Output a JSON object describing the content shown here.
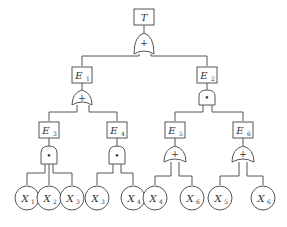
{
  "diagram": {
    "type": "fault-tree",
    "top": {
      "label": "T",
      "gate": "OR",
      "gate_symbol": "+"
    },
    "events": [
      {
        "id": "E1",
        "base": "E",
        "sub": "1",
        "gate": "OR",
        "gate_symbol": "+"
      },
      {
        "id": "E2",
        "base": "E",
        "sub": "2",
        "gate": "AND",
        "gate_symbol": "•"
      },
      {
        "id": "E3",
        "base": "E",
        "sub": "3",
        "gate": "AND",
        "gate_symbol": "•"
      },
      {
        "id": "E4",
        "base": "E",
        "sub": "4",
        "gate": "AND",
        "gate_symbol": "•"
      },
      {
        "id": "E5",
        "base": "E",
        "sub": "5",
        "gate": "OR",
        "gate_symbol": "+"
      },
      {
        "id": "E6",
        "base": "E",
        "sub": "6",
        "gate": "OR",
        "gate_symbol": "+"
      }
    ],
    "leaves": [
      {
        "base": "X",
        "sub": "1",
        "parent": "E3"
      },
      {
        "base": "X",
        "sub": "2",
        "parent": "E3"
      },
      {
        "base": "X",
        "sub": "3",
        "parent": "E3"
      },
      {
        "base": "X",
        "sub": "3",
        "parent": "E4"
      },
      {
        "base": "X",
        "sub": "4",
        "parent": "E4"
      },
      {
        "base": "X",
        "sub": "4",
        "parent": "E5"
      },
      {
        "base": "X",
        "sub": "6",
        "parent": "E5"
      },
      {
        "base": "X",
        "sub": "5",
        "parent": "E6"
      },
      {
        "base": "X",
        "sub": "6",
        "parent": "E6"
      }
    ]
  }
}
